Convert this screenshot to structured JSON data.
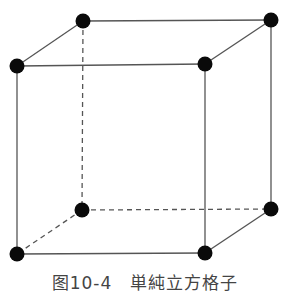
{
  "figure": {
    "type": "simple-cubic-lattice",
    "caption": "图10-4　単純立方格子",
    "colors": {
      "edge": "#555555",
      "atom": "#0a0a0a",
      "background": "#ffffff"
    },
    "vertices": {
      "front_top_left": [
        17,
        66
      ],
      "front_top_right": [
        205,
        64
      ],
      "front_bottom_left": [
        17,
        254
      ],
      "front_bottom_right": [
        205,
        253
      ],
      "back_top_left": [
        83,
        21
      ],
      "back_top_right": [
        271,
        20
      ],
      "back_bottom_left": [
        82,
        210
      ],
      "back_bottom_right": [
        271,
        209
      ]
    },
    "hidden_edges": [
      "back_top_left-back_bottom_left",
      "back_bottom_left-back_bottom_right",
      "back_bottom_left-front_bottom_left"
    ],
    "atom_count": 8
  }
}
